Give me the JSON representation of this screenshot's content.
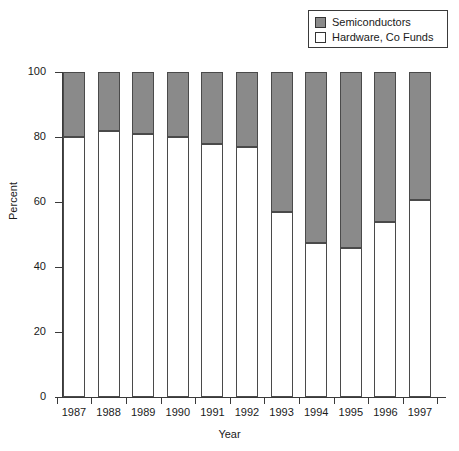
{
  "chart_data": {
    "type": "bar",
    "subtype": "stacked-percent",
    "title": "",
    "xlabel": "Year",
    "ylabel": "Percent",
    "categories": [
      "1987",
      "1988",
      "1989",
      "1990",
      "1991",
      "1992",
      "1993",
      "1994",
      "1995",
      "1996",
      "1997"
    ],
    "series": [
      {
        "name": "Semiconductors",
        "color": "#8a8a8a",
        "values": [
          20,
          18,
          19,
          20,
          22,
          23,
          43,
          52.5,
          54,
          46,
          39.5
        ]
      },
      {
        "name": "Hardware, Co Funds",
        "color": "#ffffff",
        "values": [
          80,
          82,
          81,
          80,
          78,
          77,
          57,
          47.5,
          46,
          54,
          60.5
        ]
      }
    ],
    "ylim": [
      0,
      100
    ],
    "yticks": [
      0,
      20,
      40,
      60,
      80,
      100
    ],
    "ytick_labels": [
      "0",
      "20",
      "40",
      "60",
      "80",
      "100"
    ],
    "grid": false,
    "legend_position": "top-right",
    "legend_entries": [
      "Semiconductors",
      "Hardware, Co Funds"
    ]
  },
  "legend": {
    "items": [
      {
        "label": "Semiconductors",
        "swatch": "#8a8a8a"
      },
      {
        "label": "Hardware, Co Funds",
        "swatch": "#ffffff"
      }
    ]
  },
  "axes": {
    "y_title": "Percent",
    "x_title": "Year"
  },
  "colors": {
    "semiconductors": "#8a8a8a",
    "hardware": "#ffffff",
    "axis": "#3a3a3a",
    "bar_outline": "#4a4a4a",
    "background": "#ffffff"
  }
}
